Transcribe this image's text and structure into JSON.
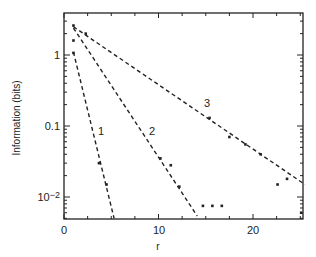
{
  "chart_data": {
    "type": "scatter",
    "title": "",
    "xlabel": "r",
    "ylabel": "Information (bits)",
    "xlim": [
      0,
      25.5
    ],
    "ylim": [
      0.005,
      3.9
    ],
    "yscale": "log",
    "grid": false,
    "legend": "none (curves labelled inline 1, 2, 3)",
    "x_ticks": [
      "0",
      "10",
      "20"
    ],
    "y_ticks": [
      "10^-2",
      "0.1",
      "1"
    ],
    "series": [
      {
        "name": "1",
        "line": {
          "style": "dashed",
          "from": [
            1.0,
            1.1
          ],
          "to": [
            5.3,
            0.005
          ]
        },
        "points": [
          [
            1,
            1.07
          ],
          [
            3.7,
            0.03
          ],
          [
            4.5,
            0.015
          ]
        ],
        "label_position": [
          3.5,
          0.09
        ]
      },
      {
        "name": "2",
        "line": {
          "style": "dashed",
          "from": [
            1.0,
            2.4
          ],
          "to": [
            14.1,
            0.0054
          ]
        },
        "points": [
          [
            1,
            1.6
          ],
          [
            10.2,
            0.035
          ],
          [
            11.3,
            0.028
          ],
          [
            12.2,
            0.014
          ],
          [
            14.7,
            0.0075
          ],
          [
            15.7,
            0.0075
          ],
          [
            16.7,
            0.0075
          ]
        ],
        "label_position": [
          9.2,
          0.09
        ]
      },
      {
        "name": "3",
        "line": {
          "style": "dashed",
          "from": [
            1.0,
            2.5
          ],
          "to": [
            25.5,
            0.015
          ]
        },
        "points": [
          [
            1,
            2.6
          ],
          [
            2.3,
            2.0
          ],
          [
            15.4,
            0.13
          ],
          [
            17.5,
            0.07
          ],
          [
            19.2,
            0.055
          ],
          [
            20.8,
            0.04
          ],
          [
            22.6,
            0.015
          ],
          [
            23.6,
            0.018
          ],
          [
            25.1,
            0.006
          ]
        ],
        "label_position": [
          15.3,
          0.32
        ]
      }
    ]
  },
  "axes": {
    "x_label": "r",
    "y_label": "Information (bits)",
    "x_tick_labels": [
      "0",
      "10",
      "20"
    ],
    "y_tick_labels": {
      "one": "1",
      "tenth": "0.1",
      "hundredth_base": "10",
      "hundredth_exp": "−2"
    }
  },
  "curve_labels": [
    "1",
    "2",
    "3"
  ]
}
